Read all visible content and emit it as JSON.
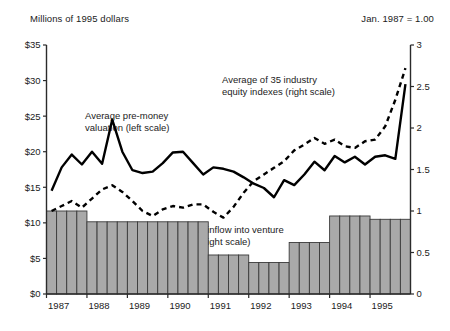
{
  "header": {
    "left_units": "Millions of 1995 dollars",
    "right_units": "Jan. 1987 = 1.00"
  },
  "annotations": {
    "valuation_line1": "Average pre-money",
    "valuation_line2": "valuation (left scale)",
    "equity_line1": "Average of 35 industry",
    "equity_line2": "equity indexes (right scale)",
    "inflow_line1": "Annual inflow into venture",
    "inflow_line2": "funds (right scale)"
  },
  "chart_data": {
    "type": "line",
    "title": "",
    "xlabel": "",
    "ylabel": "Millions of 1995 dollars",
    "y2label": "Jan. 1987 = 1.00",
    "grid": false,
    "legend": "annotations-inline",
    "x_tick_labels": [
      "1987",
      "1988",
      "1989",
      "1990",
      "1991",
      "1992",
      "1993",
      "1994",
      "1995"
    ],
    "x_quarters": [
      "1987Q1",
      "1987Q2",
      "1987Q3",
      "1987Q4",
      "1988Q1",
      "1988Q2",
      "1988Q3",
      "1988Q4",
      "1989Q1",
      "1989Q2",
      "1989Q3",
      "1989Q4",
      "1990Q1",
      "1990Q2",
      "1990Q3",
      "1990Q4",
      "1991Q1",
      "1991Q2",
      "1991Q3",
      "1991Q4",
      "1992Q1",
      "1992Q2",
      "1992Q3",
      "1992Q4",
      "1993Q1",
      "1993Q2",
      "1993Q3",
      "1993Q4",
      "1994Q1",
      "1994Q2",
      "1994Q3",
      "1994Q4",
      "1995Q1",
      "1995Q2",
      "1995Q3",
      "1995Q4"
    ],
    "ylim": [
      0,
      35
    ],
    "y_ticks": [
      0,
      5,
      10,
      15,
      20,
      25,
      30,
      35
    ],
    "y_tick_labels": [
      "$0",
      "$5",
      "$10",
      "$15",
      "$20",
      "$25",
      "$30",
      "$35"
    ],
    "y2lim": [
      0,
      3
    ],
    "y2_ticks": [
      0,
      0.5,
      1,
      1.5,
      2,
      2.5,
      3
    ],
    "y2_tick_labels": [
      "0",
      "0.5",
      "1",
      "1.5",
      "2",
      "2.5",
      "3"
    ],
    "series": [
      {
        "name": "Average pre-money valuation (left scale)",
        "axis": "left",
        "style": "solid",
        "color": "#000000",
        "values": [
          14.5,
          17.8,
          19.6,
          18.2,
          20.0,
          18.3,
          24.5,
          20.0,
          17.4,
          17.0,
          17.2,
          18.4,
          19.9,
          20.0,
          18.4,
          16.8,
          17.8,
          17.6,
          17.2,
          16.4,
          15.5,
          14.9,
          13.6,
          16.0,
          15.3,
          16.8,
          18.6,
          17.4,
          19.4,
          18.5,
          19.3,
          18.2,
          19.3,
          19.5,
          19.0,
          29.5
        ]
      },
      {
        "name": "Average of 35 industry equity indexes (right scale)",
        "axis": "right",
        "style": "dashed",
        "color": "#000000",
        "values": [
          1.0,
          1.06,
          1.12,
          1.04,
          1.15,
          1.26,
          1.31,
          1.23,
          1.12,
          1.0,
          0.94,
          1.02,
          1.06,
          1.04,
          1.08,
          1.08,
          0.99,
          0.92,
          1.05,
          1.22,
          1.36,
          1.44,
          1.52,
          1.6,
          1.73,
          1.8,
          1.88,
          1.81,
          1.86,
          1.78,
          1.76,
          1.84,
          1.86,
          2.02,
          2.34,
          2.72
        ]
      },
      {
        "name": "Annual inflow into venture funds (right scale)",
        "axis": "right",
        "style": "bars",
        "color": "#a9a9a9",
        "values": [
          1.0,
          1.0,
          1.0,
          1.0,
          0.87,
          0.87,
          0.87,
          0.87,
          0.87,
          0.87,
          0.87,
          0.87,
          0.87,
          0.87,
          0.87,
          0.87,
          0.47,
          0.47,
          0.47,
          0.47,
          0.38,
          0.38,
          0.38,
          0.38,
          0.62,
          0.62,
          0.62,
          0.62,
          0.94,
          0.94,
          0.94,
          0.94,
          0.9,
          0.9,
          0.9,
          0.9
        ]
      }
    ]
  }
}
